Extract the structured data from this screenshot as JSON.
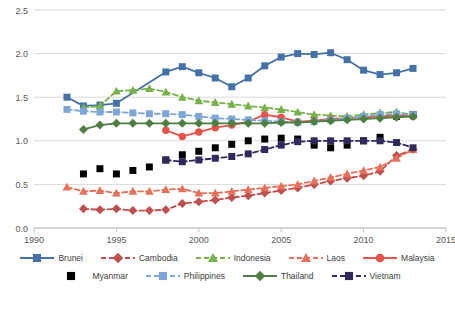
{
  "chart_data": {
    "type": "line",
    "title": "",
    "xlabel": "",
    "ylabel": "",
    "xlim": [
      1990,
      2015
    ],
    "ylim": [
      0.0,
      2.5
    ],
    "xticks": [
      1990,
      1995,
      2000,
      2005,
      2010,
      2015
    ],
    "yticks": [
      "0.0",
      "0.5",
      "1.0",
      "1.5",
      "2.0",
      "2.5"
    ],
    "grid": "horizontal",
    "legend_position": "bottom",
    "series": [
      {
        "name": "Brunei",
        "color": "#4472a8",
        "marker": "square",
        "dash": "solid",
        "points": [
          [
            1992,
            1.5
          ],
          [
            1993,
            1.4
          ],
          [
            1994,
            1.41
          ],
          [
            1995,
            1.43
          ],
          [
            1998,
            1.79
          ],
          [
            1999,
            1.85
          ],
          [
            2000,
            1.78
          ],
          [
            2001,
            1.72
          ],
          [
            2002,
            1.62
          ],
          [
            2003,
            1.72
          ],
          [
            2004,
            1.86
          ],
          [
            2005,
            1.96
          ],
          [
            2006,
            2.0
          ],
          [
            2007,
            1.99
          ],
          [
            2008,
            2.01
          ],
          [
            2009,
            1.93
          ],
          [
            2010,
            1.81
          ],
          [
            2011,
            1.76
          ],
          [
            2012,
            1.78
          ],
          [
            2013,
            1.83
          ]
        ]
      },
      {
        "name": "Cambodia",
        "color": "#c0504d",
        "marker": "diamond",
        "dash": "dashed",
        "points": [
          [
            1993,
            0.22
          ],
          [
            1994,
            0.21
          ],
          [
            1995,
            0.22
          ],
          [
            1996,
            0.2
          ],
          [
            1997,
            0.2
          ],
          [
            1998,
            0.21
          ],
          [
            1999,
            0.28
          ],
          [
            2000,
            0.3
          ],
          [
            2001,
            0.32
          ],
          [
            2002,
            0.35
          ],
          [
            2003,
            0.37
          ],
          [
            2004,
            0.4
          ],
          [
            2005,
            0.43
          ],
          [
            2006,
            0.46
          ],
          [
            2007,
            0.5
          ],
          [
            2008,
            0.54
          ],
          [
            2009,
            0.57
          ],
          [
            2010,
            0.6
          ],
          [
            2011,
            0.65
          ],
          [
            2012,
            0.83
          ],
          [
            2013,
            0.9
          ]
        ]
      },
      {
        "name": "Indonesia",
        "color": "#77b24b",
        "marker": "triangle",
        "dash": "dashed",
        "points": [
          [
            1993,
            1.38
          ],
          [
            1994,
            1.4
          ],
          [
            1995,
            1.57
          ],
          [
            1996,
            1.58
          ],
          [
            1997,
            1.6
          ],
          [
            1998,
            1.56
          ],
          [
            1999,
            1.5
          ],
          [
            2000,
            1.46
          ],
          [
            2001,
            1.44
          ],
          [
            2002,
            1.42
          ],
          [
            2003,
            1.4
          ],
          [
            2004,
            1.38
          ],
          [
            2005,
            1.36
          ],
          [
            2006,
            1.33
          ],
          [
            2007,
            1.3
          ],
          [
            2008,
            1.29
          ],
          [
            2009,
            1.28
          ],
          [
            2010,
            1.3
          ],
          [
            2011,
            1.32
          ],
          [
            2012,
            1.33
          ],
          [
            2013,
            1.3
          ]
        ]
      },
      {
        "name": "Laos",
        "color": "#e8705a",
        "marker": "triangle",
        "dash": "dashed",
        "points": [
          [
            1992,
            0.47
          ],
          [
            1993,
            0.42
          ],
          [
            1994,
            0.43
          ],
          [
            1995,
            0.4
          ],
          [
            1996,
            0.42
          ],
          [
            1997,
            0.42
          ],
          [
            1998,
            0.44
          ],
          [
            1999,
            0.45
          ],
          [
            2000,
            0.4
          ],
          [
            2001,
            0.4
          ],
          [
            2002,
            0.42
          ],
          [
            2003,
            0.44
          ],
          [
            2004,
            0.46
          ],
          [
            2005,
            0.48
          ],
          [
            2006,
            0.5
          ],
          [
            2007,
            0.54
          ],
          [
            2008,
            0.58
          ],
          [
            2009,
            0.62
          ],
          [
            2010,
            0.66
          ],
          [
            2011,
            0.7
          ],
          [
            2012,
            0.8
          ],
          [
            2013,
            0.9
          ]
        ]
      },
      {
        "name": "Malaysia",
        "color": "#e8534a",
        "marker": "circle",
        "dash": "solid",
        "points": [
          [
            1998,
            1.12
          ],
          [
            1999,
            1.05
          ],
          [
            2000,
            1.1
          ],
          [
            2001,
            1.15
          ],
          [
            2002,
            1.18
          ],
          [
            2003,
            1.22
          ],
          [
            2004,
            1.3
          ],
          [
            2005,
            1.27
          ],
          [
            2006,
            1.22
          ],
          [
            2007,
            1.23
          ],
          [
            2008,
            1.25
          ],
          [
            2009,
            1.26
          ],
          [
            2010,
            1.27
          ],
          [
            2011,
            1.28
          ],
          [
            2012,
            1.29
          ],
          [
            2013,
            1.28
          ]
        ]
      },
      {
        "name": "Myanmar",
        "color": "#77c croak",
        "marker": "square",
        "dash": "dashed",
        "points": [
          [
            1993,
            0.62
          ],
          [
            1994,
            0.68
          ],
          [
            1995,
            0.62
          ],
          [
            1996,
            0.66
          ],
          [
            1997,
            0.7
          ],
          [
            1998,
            0.78
          ],
          [
            1999,
            0.84
          ],
          [
            2000,
            0.88
          ],
          [
            2001,
            0.92
          ],
          [
            2002,
            0.96
          ],
          [
            2003,
            1.0
          ],
          [
            2004,
            1.02
          ],
          [
            2005,
            1.03
          ],
          [
            2006,
            1.02
          ],
          [
            2007,
            0.95
          ],
          [
            2008,
            0.92
          ],
          [
            2009,
            0.95
          ],
          [
            2010,
            1.0
          ],
          [
            2011,
            1.04
          ],
          [
            2012,
            1.28
          ],
          [
            2013,
            1.3
          ]
        ]
      },
      {
        "name": "Philippines",
        "color": "#7ea6d8",
        "marker": "square",
        "dash": "dashed",
        "points": [
          [
            1992,
            1.36
          ],
          [
            1993,
            1.34
          ],
          [
            1994,
            1.33
          ],
          [
            1995,
            1.33
          ],
          [
            1996,
            1.32
          ],
          [
            1997,
            1.31
          ],
          [
            1998,
            1.31
          ],
          [
            1999,
            1.3
          ],
          [
            2000,
            1.28
          ],
          [
            2001,
            1.26
          ],
          [
            2002,
            1.25
          ],
          [
            2003,
            1.24
          ],
          [
            2004,
            1.23
          ],
          [
            2005,
            1.22
          ],
          [
            2006,
            1.21
          ],
          [
            2007,
            1.22
          ],
          [
            2008,
            1.24
          ],
          [
            2009,
            1.26
          ],
          [
            2010,
            1.28
          ],
          [
            2011,
            1.3
          ],
          [
            2012,
            1.31
          ],
          [
            2013,
            1.3
          ]
        ]
      },
      {
        "name": "Thailand",
        "color": "#4e7f42",
        "marker": "diamond",
        "dash": "solid",
        "points": [
          [
            1993,
            1.13
          ],
          [
            1994,
            1.18
          ],
          [
            1995,
            1.2
          ],
          [
            1996,
            1.2
          ],
          [
            1997,
            1.2
          ],
          [
            1998,
            1.2
          ],
          [
            1999,
            1.2
          ],
          [
            2000,
            1.2
          ],
          [
            2001,
            1.2
          ],
          [
            2002,
            1.2
          ],
          [
            2003,
            1.2
          ],
          [
            2004,
            1.2
          ],
          [
            2005,
            1.21
          ],
          [
            2006,
            1.21
          ],
          [
            2007,
            1.22
          ],
          [
            2008,
            1.23
          ],
          [
            2009,
            1.24
          ],
          [
            2010,
            1.25
          ],
          [
            2011,
            1.26
          ],
          [
            2012,
            1.27
          ],
          [
            2013,
            1.28
          ]
        ]
      },
      {
        "name": "Vietnam",
        "color": "#2e2a5e",
        "marker": "square",
        "dash": "dashed",
        "points": [
          [
            1998,
            0.78
          ],
          [
            1999,
            0.76
          ],
          [
            2000,
            0.78
          ],
          [
            2001,
            0.8
          ],
          [
            2002,
            0.82
          ],
          [
            2003,
            0.85
          ],
          [
            2004,
            0.9
          ],
          [
            2005,
            0.95
          ],
          [
            2006,
            0.99
          ],
          [
            2007,
            1.0
          ],
          [
            2008,
            1.0
          ],
          [
            2009,
            1.0
          ],
          [
            2010,
            1.0
          ],
          [
            2011,
            1.0
          ],
          [
            2012,
            0.98
          ],
          [
            2013,
            0.92
          ]
        ]
      }
    ]
  },
  "legend": {
    "row1": [
      "Brunei",
      "Cambodia",
      "Indonesia",
      "Laos",
      "Malaysia"
    ],
    "row2": [
      "Myanmar",
      "Philippines",
      "Thailand",
      "Vietnam"
    ]
  },
  "colors": {
    "axis": "#bfbfbf",
    "grid": "#d9d9d9",
    "tick_text": "#595959",
    "background": "#ffffff"
  }
}
